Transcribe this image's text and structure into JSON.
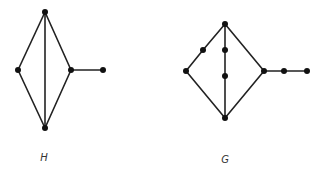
{
  "graphs": [
    {
      "id": "H",
      "label": "H",
      "label_pos": [
        44,
        157
      ],
      "vertices": [
        {
          "id": "h_top",
          "x": 45,
          "y": 12
        },
        {
          "id": "h_left",
          "x": 18,
          "y": 70
        },
        {
          "id": "h_right",
          "x": 71,
          "y": 70
        },
        {
          "id": "h_tail",
          "x": 103,
          "y": 70
        },
        {
          "id": "h_bottom",
          "x": 45,
          "y": 128
        }
      ],
      "edges": [
        [
          "h_top",
          "h_left"
        ],
        [
          "h_top",
          "h_right"
        ],
        [
          "h_top",
          "h_bottom"
        ],
        [
          "h_left",
          "h_bottom"
        ],
        [
          "h_right",
          "h_bottom"
        ],
        [
          "h_right",
          "h_tail"
        ]
      ]
    },
    {
      "id": "G",
      "label": "G",
      "label_pos": [
        225,
        159
      ],
      "vertices": [
        {
          "id": "g_top",
          "x": 225,
          "y": 24
        },
        {
          "id": "g_sub_left",
          "x": 203,
          "y": 50
        },
        {
          "id": "g_mid1",
          "x": 225,
          "y": 50
        },
        {
          "id": "g_mid2",
          "x": 225,
          "y": 76
        },
        {
          "id": "g_left",
          "x": 186,
          "y": 71
        },
        {
          "id": "g_right",
          "x": 264,
          "y": 71
        },
        {
          "id": "g_tail1",
          "x": 284,
          "y": 71
        },
        {
          "id": "g_tail2",
          "x": 307,
          "y": 71
        },
        {
          "id": "g_bottom",
          "x": 225,
          "y": 118
        }
      ],
      "edges": [
        [
          "g_top",
          "g_sub_left"
        ],
        [
          "g_sub_left",
          "g_left"
        ],
        [
          "g_top",
          "g_mid1"
        ],
        [
          "g_mid1",
          "g_mid2"
        ],
        [
          "g_mid2",
          "g_bottom"
        ],
        [
          "g_top",
          "g_right"
        ],
        [
          "g_left",
          "g_bottom"
        ],
        [
          "g_right",
          "g_bottom"
        ],
        [
          "g_right",
          "g_tail1"
        ],
        [
          "g_tail1",
          "g_tail2"
        ]
      ]
    }
  ],
  "style": {
    "edge_color": "#222222",
    "vertex_color": "#111111",
    "vertex_radius": 3
  }
}
